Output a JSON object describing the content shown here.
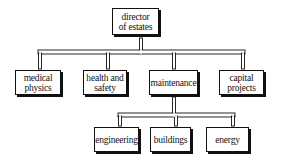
{
  "diagram": {
    "type": "org-chart",
    "root": {
      "label_line1": "director",
      "label_line2": "of estates"
    },
    "level2": [
      {
        "line1": "medical",
        "line2": "physics"
      },
      {
        "line1": "health and",
        "line2": "safety"
      },
      {
        "line1": "maintenance",
        "line2": ""
      },
      {
        "line1": "capital",
        "line2": "projects"
      }
    ],
    "level3_parent": "maintenance",
    "level3": [
      {
        "line1": "engineering"
      },
      {
        "line1": "buildings"
      },
      {
        "line1": "energy"
      }
    ]
  },
  "colors": {
    "line": "#111111",
    "background": "#ffffff"
  }
}
